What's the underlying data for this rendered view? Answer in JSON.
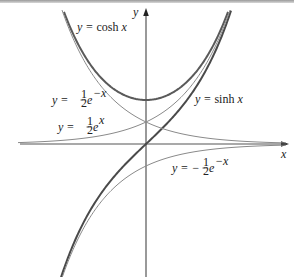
{
  "figure": {
    "axes": {
      "x_label": "x",
      "y_label": "y"
    },
    "labels": {
      "cosh": {
        "lhs": "y = ",
        "fn": "cosh",
        "var": "x"
      },
      "sinh": {
        "lhs": "y = ",
        "fn": "sinh",
        "var": "x"
      },
      "half_e_neg_x": {
        "lhs": "y = ",
        "frac_num": "1",
        "frac_den": "2",
        "base": "e",
        "exp": "−x"
      },
      "half_e_x": {
        "lhs": "y = ",
        "frac_num": "1",
        "frac_den": "2",
        "base": "e",
        "exp": "x"
      },
      "neg_half_e_neg_x": {
        "lhs": "y = −",
        "frac_num": "1",
        "frac_den": "2",
        "base": "e",
        "exp": "−x"
      }
    },
    "colors": {
      "axis": "#555555",
      "cosh": "#5a5a5a",
      "sinh": "#4a4a4a",
      "thin_curves": "#8a8a8a"
    }
  },
  "chart_data": {
    "type": "line",
    "title": "",
    "xlabel": "x",
    "ylabel": "y",
    "grid": false,
    "xlim": [
      -3.1,
      3.1
    ],
    "ylim": [
      -3.0,
      3.2
    ],
    "series": [
      {
        "name": "y = cosh x",
        "expression": "cosh(x)",
        "style": "thick"
      },
      {
        "name": "y = sinh x",
        "expression": "sinh(x)",
        "style": "thick"
      },
      {
        "name": "y = ½e^(−x)",
        "expression": "0.5*exp(-x)",
        "style": "thin"
      },
      {
        "name": "y = ½e^x",
        "expression": "0.5*exp(x)",
        "style": "thin"
      },
      {
        "name": "y = −½e^(−x)",
        "expression": "-0.5*exp(-x)",
        "style": "thin"
      }
    ],
    "key_points": [
      {
        "label": "cosh minimum",
        "x": 0,
        "y": 1
      },
      {
        "label": "½e^x and ½e^(−x) intersect",
        "x": 0,
        "y": 0.5
      },
      {
        "label": "sinh passes origin",
        "x": 0,
        "y": 0
      },
      {
        "label": "−½e^(−x) y-intercept",
        "x": 0,
        "y": -0.5
      }
    ]
  }
}
